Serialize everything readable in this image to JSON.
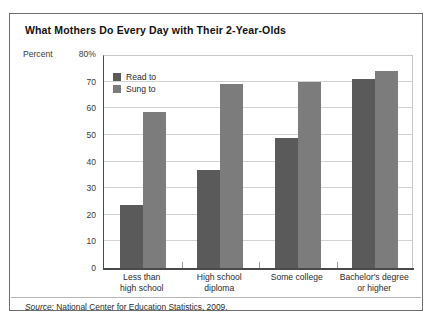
{
  "chart_data": {
    "type": "bar",
    "title": "What Mothers Do Every Day with Their 2-Year-Olds",
    "xlabel": "",
    "ylabel": "Percent",
    "ylim": [
      0,
      80
    ],
    "ytick_labels": [
      "80%",
      "70",
      "60",
      "50",
      "40",
      "30",
      "20",
      "10",
      "0"
    ],
    "ytick_values": [
      80,
      70,
      60,
      50,
      40,
      30,
      20,
      10,
      0
    ],
    "grid": true,
    "legend_position": "top-left-inside",
    "categories": [
      "Less than high school",
      "High school diploma",
      "Some college",
      "Bachelor's degree or higher"
    ],
    "category_lines": [
      [
        "Less than",
        "high school"
      ],
      [
        "High school",
        "diploma"
      ],
      [
        "Some college",
        ""
      ],
      [
        "Bachelor's degree",
        "or higher"
      ]
    ],
    "series": [
      {
        "name": "Read to",
        "color": "#5a5a5a",
        "values": [
          23.5,
          37,
          49,
          71
        ]
      },
      {
        "name": "Sung to",
        "color": "#7c7c7c",
        "values": [
          58.5,
          69,
          70,
          74
        ]
      }
    ],
    "source": {
      "prefix": "Source:",
      "text": "National Center for Education Statistics, 2009."
    }
  }
}
